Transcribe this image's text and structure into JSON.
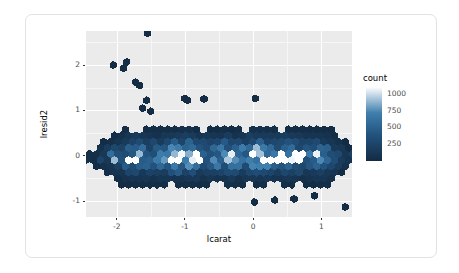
{
  "chart_data": {
    "type": "heatmap",
    "subtype": "hexbin",
    "title": "",
    "xlabel": "lcarat",
    "ylabel": "lresid2",
    "xlim": [
      -2.45,
      1.45
    ],
    "ylim": [
      -1.35,
      2.75
    ],
    "xticks": [
      -2,
      -1,
      0,
      1
    ],
    "xtick_labels": [
      "-2",
      "-1",
      "0",
      "1"
    ],
    "yticks": [
      -1,
      0,
      1,
      2
    ],
    "ytick_labels": [
      "-1",
      "0",
      "1",
      "2"
    ],
    "grid": true,
    "grid_color": "#ffffff",
    "panel_background": "#ebebeb",
    "legend": {
      "title": "count",
      "position": "right",
      "ticks": [
        250,
        500,
        750,
        1000
      ],
      "tick_labels": [
        "250",
        "500",
        "750",
        "1000"
      ],
      "range": [
        0,
        1100
      ],
      "low_color": "#132b43",
      "high_color": "#ffffff",
      "scale": "continuous"
    },
    "bins": [
      {
        "x": -2.4,
        "y": 0.0,
        "count": 40
      },
      {
        "x": -2.4,
        "y": 0.15,
        "count": 30
      },
      {
        "x": -2.4,
        "y": 0.3,
        "count": 20
      },
      {
        "x": -2.3,
        "y": 0.7,
        "count": 15
      },
      {
        "x": -2.25,
        "y": 0.0,
        "count": 120
      },
      {
        "x": -2.2,
        "y": -0.15,
        "count": 140
      },
      {
        "x": -2.1,
        "y": 0.05,
        "count": 220
      },
      {
        "x": -2.0,
        "y": 0.0,
        "count": 320
      },
      {
        "x": -1.9,
        "y": -0.05,
        "count": 420
      },
      {
        "x": -1.8,
        "y": 0.0,
        "count": 640
      },
      {
        "x": -1.7,
        "y": 0.05,
        "count": 700
      },
      {
        "x": -1.6,
        "y": -0.05,
        "count": 560
      },
      {
        "x": -1.5,
        "y": 0.0,
        "count": 480
      },
      {
        "x": -1.4,
        "y": -0.05,
        "count": 520
      },
      {
        "x": -1.3,
        "y": 0.0,
        "count": 700
      },
      {
        "x": -1.2,
        "y": 0.0,
        "count": 820
      },
      {
        "x": -1.1,
        "y": -0.05,
        "count": 900
      },
      {
        "x": -1.0,
        "y": 0.0,
        "count": 980
      },
      {
        "x": -0.9,
        "y": -0.05,
        "count": 860
      },
      {
        "x": -0.8,
        "y": 0.0,
        "count": 620
      },
      {
        "x": -0.7,
        "y": -0.05,
        "count": 540
      },
      {
        "x": -0.6,
        "y": 0.0,
        "count": 600
      },
      {
        "x": -0.5,
        "y": -0.05,
        "count": 700
      },
      {
        "x": -0.4,
        "y": 0.0,
        "count": 820
      },
      {
        "x": -0.3,
        "y": -0.05,
        "count": 760
      },
      {
        "x": -0.2,
        "y": 0.0,
        "count": 640
      },
      {
        "x": -0.1,
        "y": -0.05,
        "count": 700
      },
      {
        "x": 0.0,
        "y": 0.0,
        "count": 1060
      },
      {
        "x": 0.1,
        "y": -0.05,
        "count": 980
      },
      {
        "x": 0.2,
        "y": 0.0,
        "count": 820
      },
      {
        "x": 0.3,
        "y": -0.05,
        "count": 660
      },
      {
        "x": 0.4,
        "y": 0.0,
        "count": 740
      },
      {
        "x": 0.5,
        "y": -0.05,
        "count": 820
      },
      {
        "x": 0.6,
        "y": 0.0,
        "count": 700
      },
      {
        "x": 0.7,
        "y": -0.05,
        "count": 520
      },
      {
        "x": 0.8,
        "y": 0.0,
        "count": 460
      },
      {
        "x": 0.9,
        "y": -0.05,
        "count": 520
      },
      {
        "x": 1.0,
        "y": 0.0,
        "count": 620
      },
      {
        "x": 1.1,
        "y": -0.05,
        "count": 460
      },
      {
        "x": 1.2,
        "y": 0.0,
        "count": 300
      },
      {
        "x": 1.3,
        "y": -0.05,
        "count": 160
      },
      {
        "x": 1.38,
        "y": 0.0,
        "count": 60
      }
    ],
    "outliers": [
      {
        "x": -1.55,
        "y": 2.7
      },
      {
        "x": -2.05,
        "y": 2.0
      },
      {
        "x": -1.9,
        "y": 1.93
      },
      {
        "x": -1.85,
        "y": 2.07
      },
      {
        "x": -1.72,
        "y": 1.62
      },
      {
        "x": -1.66,
        "y": 1.55
      },
      {
        "x": -1.56,
        "y": 1.22
      },
      {
        "x": -1.0,
        "y": 1.26
      },
      {
        "x": -0.96,
        "y": 1.22
      },
      {
        "x": -0.72,
        "y": 1.25
      },
      {
        "x": 0.03,
        "y": 1.26
      },
      {
        "x": -1.62,
        "y": 1.05
      },
      {
        "x": -1.5,
        "y": 0.98
      },
      {
        "x": 0.02,
        "y": -1.02
      },
      {
        "x": 0.32,
        "y": -0.98
      },
      {
        "x": 0.6,
        "y": -0.95
      },
      {
        "x": 0.9,
        "y": -0.88
      },
      {
        "x": 1.35,
        "y": -1.13
      }
    ]
  }
}
